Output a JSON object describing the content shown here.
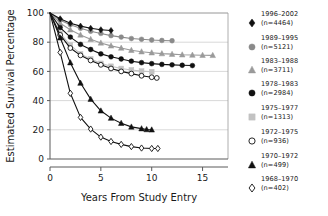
{
  "chart_data": {
    "type": "line",
    "title": "",
    "xlabel": "Years From Study Entry",
    "ylabel": "Estimated Survival Percentage",
    "xlim": [
      0,
      17.5
    ],
    "ylim": [
      0,
      100
    ],
    "xticks": [
      0,
      5,
      10,
      15
    ],
    "yticks": [
      0,
      20,
      40,
      60,
      80,
      100
    ],
    "grid": "horizontal",
    "legend_position": "right",
    "series": [
      {
        "name": "1996-2002",
        "label_line1": "1996–2002",
        "label_line2": "(n=4464)",
        "n": 4464,
        "marker": "filled-diamond",
        "color": "#111111",
        "x": [
          0,
          1,
          2,
          3,
          4,
          5,
          6
        ],
        "y": [
          100,
          96,
          93,
          91,
          89.5,
          88.5,
          88
        ]
      },
      {
        "name": "1989-1995",
        "label_line1": "1989–1995",
        "label_line2": "(n=5121)",
        "n": 5121,
        "marker": "filled-circle",
        "color": "#8a8a8a",
        "x": [
          0,
          1,
          2,
          3,
          4,
          5,
          6,
          7,
          8,
          9,
          10,
          11,
          12
        ],
        "y": [
          100,
          95,
          92,
          89.5,
          87.5,
          86,
          84.5,
          83.5,
          82.5,
          82,
          81.5,
          81.2,
          81
        ]
      },
      {
        "name": "1983-1988",
        "label_line1": "1983–1988",
        "label_line2": "(n=3711)",
        "n": 3711,
        "marker": "filled-triangle",
        "color": "#9a9a9a",
        "x": [
          0,
          1,
          2,
          3,
          4,
          5,
          6,
          7,
          8,
          9,
          10,
          11,
          12,
          13,
          14,
          15,
          16
        ],
        "y": [
          100,
          93,
          88.5,
          85,
          82,
          79.5,
          77.5,
          76,
          74.5,
          73.5,
          72.8,
          72.2,
          71.8,
          71.4,
          71.2,
          71.1,
          71
        ]
      },
      {
        "name": "1978-1983",
        "label_line1": "1978–1983",
        "label_line2": "(n=2984)",
        "n": 2984,
        "marker": "filled-circle",
        "color": "#111111",
        "x": [
          0,
          1,
          2,
          3,
          4,
          5,
          6,
          7,
          8,
          9,
          10,
          11,
          12,
          13,
          14
        ],
        "y": [
          100,
          90,
          83.5,
          78.5,
          75,
          72,
          70,
          68.5,
          67,
          66,
          65.3,
          64.8,
          64.5,
          64.2,
          64
        ]
      },
      {
        "name": "1975-1977",
        "label_line1": "1975–1977",
        "label_line2": "(n=1313)",
        "n": 1313,
        "marker": "filled-square",
        "color": "#c2c2c2",
        "x": [
          0,
          1,
          2,
          3,
          4,
          5,
          6,
          7,
          8,
          9,
          10
        ],
        "y": [
          100,
          86,
          78,
          72,
          68.5,
          65.5,
          63.5,
          62,
          61,
          60.2,
          59.8
        ]
      },
      {
        "name": "1972-1975",
        "label_line1": "1972–1975",
        "label_line2": "(n=936)",
        "n": 936,
        "marker": "open-circle",
        "color": "#111111",
        "x": [
          0,
          1,
          2,
          3,
          4,
          5,
          6,
          7,
          8,
          9,
          10,
          10.5
        ],
        "y": [
          100,
          85,
          76,
          71,
          67.5,
          64.5,
          62,
          60,
          58.5,
          57,
          56,
          55.5
        ]
      },
      {
        "name": "1970-1972",
        "label_line1": "1970–1972",
        "label_line2": "(n=499)",
        "n": 499,
        "marker": "filled-triangle",
        "color": "#111111",
        "x": [
          0,
          1,
          2,
          3,
          4,
          5,
          6,
          7,
          8,
          9,
          9.5,
          10
        ],
        "y": [
          100,
          83,
          66,
          52,
          41,
          33,
          28,
          24.5,
          22,
          20.8,
          20.2,
          20
        ]
      },
      {
        "name": "1968-1970",
        "label_line1": "1968–1970",
        "label_line2": "(n=402)",
        "n": 402,
        "marker": "open-diamond",
        "color": "#111111",
        "x": [
          0,
          1,
          2,
          3,
          4,
          5,
          6,
          7,
          8,
          9,
          10,
          10.6
        ],
        "y": [
          100,
          73,
          45,
          28.5,
          20.5,
          15,
          12,
          10,
          8.5,
          7.5,
          7.2,
          7.2
        ]
      }
    ]
  }
}
